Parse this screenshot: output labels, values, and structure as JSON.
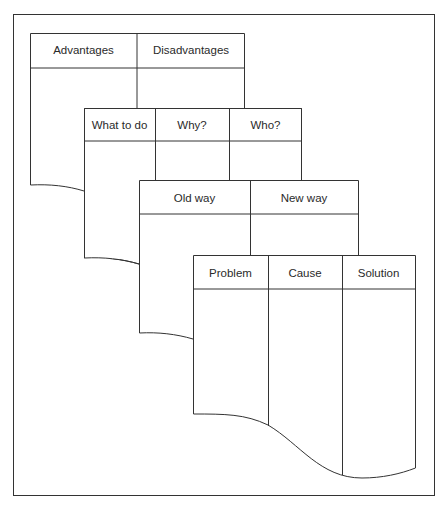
{
  "diagram": {
    "title": "",
    "cards": [
      {
        "id": "advantages",
        "columns": [
          "Advantages",
          "Disadvantages"
        ]
      },
      {
        "id": "action",
        "columns": [
          "What to do",
          "Why?",
          "Who?"
        ]
      },
      {
        "id": "change",
        "columns": [
          "Old way",
          "New way"
        ]
      },
      {
        "id": "analysis",
        "columns": [
          "Problem",
          "Cause",
          "Solution"
        ]
      }
    ],
    "colors": {
      "line": "#333333",
      "background": "#ffffff",
      "text": "#2a2a2a"
    }
  }
}
